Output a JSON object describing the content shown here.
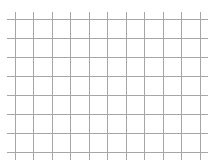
{
  "grid": {
    "background": "#ffffff",
    "line_color": "#a6a6a6",
    "vertical_lines_x": [
      15.5,
      33.5,
      52.5,
      70.5,
      89.5,
      107.5,
      126.5,
      144.5,
      163.5,
      181.5,
      200.5
    ],
    "vertical_extent": [
      12,
      160
    ],
    "horizontal_lines_y": [
      19.5,
      38.5,
      57.5,
      76.5,
      95.5,
      114.5,
      133.5,
      152.5
    ],
    "horizontal_extent": [
      7,
      208
    ],
    "columns": 10,
    "rows": 7
  }
}
